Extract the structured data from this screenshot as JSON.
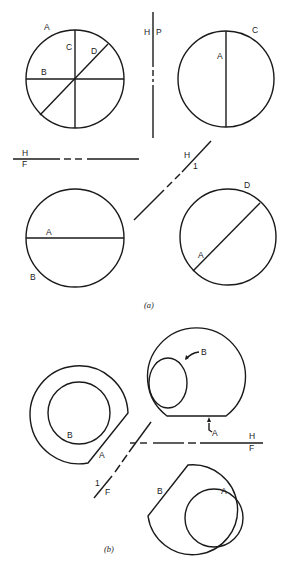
{
  "figure": {
    "panel_a": {
      "caption": "(a)",
      "top_left_circle": {
        "labels": {
          "A": "A",
          "B": "B",
          "C": "C",
          "D": "D"
        }
      },
      "top_right_circle": {
        "labels": {
          "A": "A",
          "C": "C"
        }
      },
      "bottom_left_circle": {
        "labels": {
          "A": "A",
          "B": "B"
        }
      },
      "bottom_right_circle": {
        "labels": {
          "A": "A",
          "D": "D"
        }
      },
      "folding_lines": {
        "hp": {
          "top": "H",
          "bottom": "P"
        },
        "hf": {
          "top": "H",
          "bottom": "F"
        },
        "h1": {
          "top": "H",
          "bottom": "1"
        }
      }
    },
    "panel_b": {
      "caption": "(b)",
      "top_view": {
        "labels": {
          "A": "A",
          "B": "B"
        }
      },
      "left_view": {
        "labels": {
          "A": "A",
          "B": "B"
        }
      },
      "aux_view": {
        "labels": {
          "A": "A",
          "B": "B"
        }
      },
      "folding_lines": {
        "hf": {
          "top": "H",
          "bottom": "F"
        },
        "f1": {
          "top": "1",
          "bottom": "F"
        }
      }
    }
  }
}
